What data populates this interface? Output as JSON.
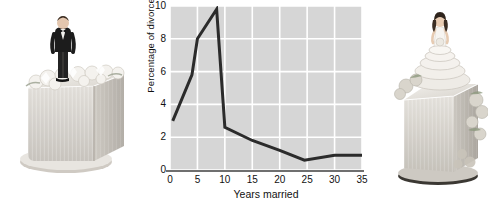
{
  "figure": {
    "left_photo": {
      "name": "groom-figurine-on-square-wedding-cake",
      "alt": "Groom figurine in black tuxedo standing on a white square wedding cake decorated with sugar flowers"
    },
    "right_photo": {
      "name": "bride-figurine-on-square-wedding-cake",
      "alt": "Bride figurine in a white tiered gown standing on a white square wedding cake decorated with flowers"
    }
  },
  "chart_data": {
    "type": "line",
    "title": "",
    "xlabel": "Years married",
    "ylabel": "Percentage of divorces",
    "xlim": [
      0,
      35
    ],
    "ylim": [
      0,
      10
    ],
    "xticks": [
      0,
      5,
      10,
      15,
      20,
      25,
      30,
      35
    ],
    "xtick_labels": [
      "0",
      "5",
      "10",
      "15",
      "20",
      "25",
      "30",
      "35"
    ],
    "yticks": [
      0,
      2,
      4,
      6,
      8,
      10
    ],
    "ytick_labels": [
      "0",
      "2",
      "4",
      "6",
      "8",
      "10"
    ],
    "grid": true,
    "grid_color": "#ffffff",
    "plot_background": "#d6d6d6",
    "line_color": "#2b2b2b",
    "line_width": 3,
    "legend": "none",
    "x": [
      0.5,
      4,
      5,
      8.5,
      10,
      15,
      20,
      24.5,
      30,
      35
    ],
    "values": [
      3.0,
      5.8,
      8.0,
      9.8,
      2.6,
      1.8,
      1.2,
      0.6,
      0.9,
      0.9
    ],
    "series": [
      {
        "name": "Percentage of divorces",
        "x": [
          0.5,
          4,
          5,
          8.5,
          10,
          15,
          20,
          24.5,
          30,
          35
        ],
        "values": [
          3.0,
          5.8,
          8.0,
          9.8,
          2.6,
          1.8,
          1.2,
          0.6,
          0.9,
          0.9
        ]
      }
    ]
  }
}
